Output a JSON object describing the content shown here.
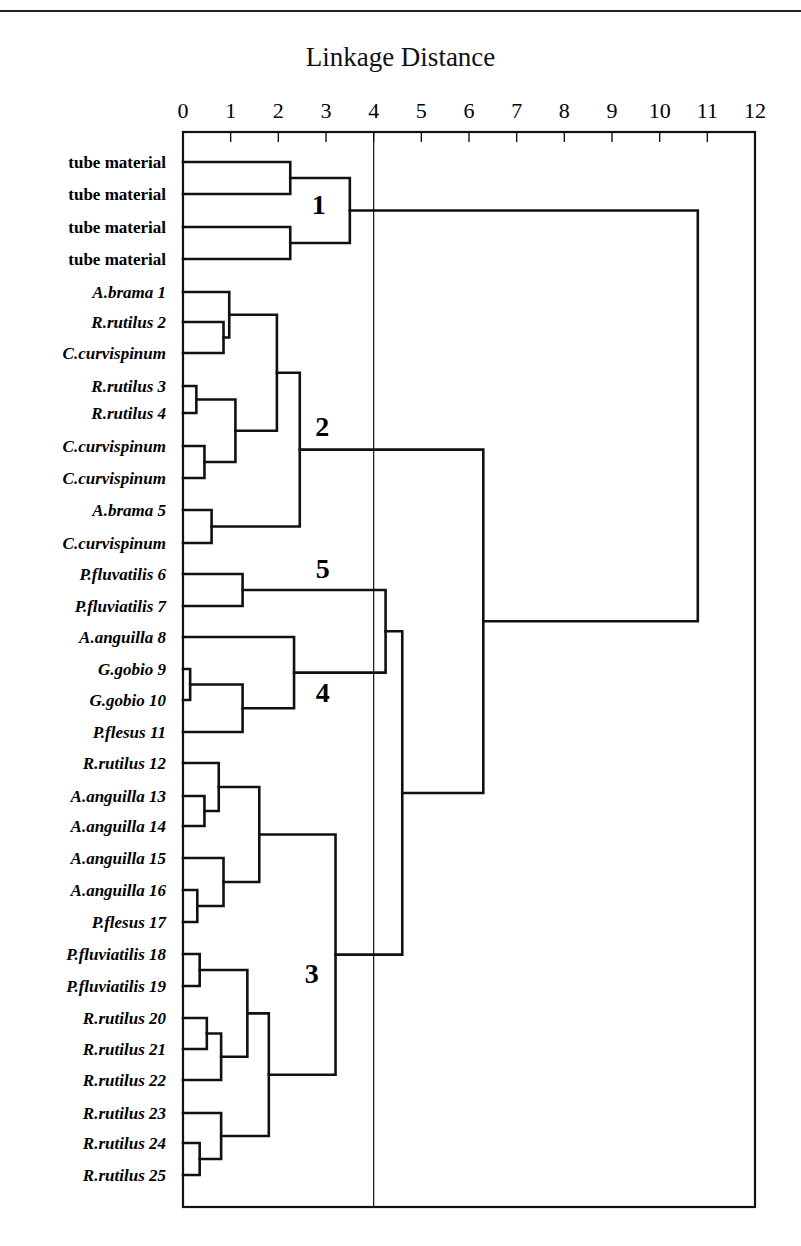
{
  "chart_data": {
    "type": "dendrogram",
    "title": "Linkage Distance",
    "xlabel": "Linkage Distance",
    "xlim": [
      0,
      12
    ],
    "x_ticks": [
      0,
      1,
      2,
      3,
      4,
      5,
      6,
      7,
      8,
      9,
      10,
      11,
      12
    ],
    "reference_line": 4,
    "orientation": "horizontal (leaves on left, distance increases to the right)",
    "leaves": [
      {
        "label": "tube material",
        "italic": false
      },
      {
        "label": "tube material",
        "italic": false
      },
      {
        "label": "tube material",
        "italic": false
      },
      {
        "label": "tube material",
        "italic": false
      },
      {
        "label": "A.brama 1",
        "italic": true
      },
      {
        "label": "R.rutilus 2",
        "italic": true
      },
      {
        "label": "C.curvispinum",
        "italic": true
      },
      {
        "label": "R.rutilus 3",
        "italic": true
      },
      {
        "label": "R.rutilus 4",
        "italic": true
      },
      {
        "label": "C.curvispinum",
        "italic": true
      },
      {
        "label": "C.curvispinum",
        "italic": true
      },
      {
        "label": "A.brama 5",
        "italic": true
      },
      {
        "label": "C.curvispinum",
        "italic": true
      },
      {
        "label": "P.fluvatilis 6",
        "italic": true
      },
      {
        "label": "P.fluviatilis 7",
        "italic": true
      },
      {
        "label": "A.anguilla 8",
        "italic": true
      },
      {
        "label": "G.gobio 9",
        "italic": true
      },
      {
        "label": "G.gobio 10",
        "italic": true
      },
      {
        "label": "P.flesus 11",
        "italic": true
      },
      {
        "label": "R.rutilus 12",
        "italic": true
      },
      {
        "label": "A.anguilla 13",
        "italic": true
      },
      {
        "label": "A.anguilla 14",
        "italic": true
      },
      {
        "label": "A.anguilla 15",
        "italic": true
      },
      {
        "label": "A.anguilla 16",
        "italic": true
      },
      {
        "label": "P.flesus 17",
        "italic": true
      },
      {
        "label": "P.fluviatilis 18",
        "italic": true
      },
      {
        "label": "P.fluviatilis 19",
        "italic": true
      },
      {
        "label": "R.rutilus 20",
        "italic": true
      },
      {
        "label": "R.rutilus 21",
        "italic": true
      },
      {
        "label": "R.rutilus 22",
        "italic": true
      },
      {
        "label": "R.rutilus 23",
        "italic": true
      },
      {
        "label": "R.rutilus 24",
        "italic": true
      },
      {
        "label": "R.rutilus 25",
        "italic": true
      }
    ],
    "merges": [
      {
        "id": "m1",
        "children": [
          "L0",
          "L1"
        ],
        "height": 2.25
      },
      {
        "id": "m2",
        "children": [
          "L2",
          "L3"
        ],
        "height": 2.25
      },
      {
        "id": "m3",
        "children": [
          "m1",
          "m2"
        ],
        "height": 3.5
      },
      {
        "id": "m4",
        "children": [
          "L5",
          "L6"
        ],
        "height": 0.85
      },
      {
        "id": "m5",
        "children": [
          "L4",
          "m4"
        ],
        "height": 0.97
      },
      {
        "id": "m6",
        "children": [
          "L7",
          "L8"
        ],
        "height": 0.28
      },
      {
        "id": "m7",
        "children": [
          "L9",
          "L10"
        ],
        "height": 0.45
      },
      {
        "id": "m8",
        "children": [
          "m6",
          "m7"
        ],
        "height": 1.1
      },
      {
        "id": "m9",
        "children": [
          "m5",
          "m8"
        ],
        "height": 1.97
      },
      {
        "id": "m10",
        "children": [
          "L11",
          "L12"
        ],
        "height": 0.6
      },
      {
        "id": "m11",
        "children": [
          "m9",
          "m10"
        ],
        "height": 2.45
      },
      {
        "id": "m12",
        "children": [
          "L13",
          "L14"
        ],
        "height": 1.25
      },
      {
        "id": "m13",
        "children": [
          "L16",
          "L17"
        ],
        "height": 0.15
      },
      {
        "id": "m14",
        "children": [
          "m13",
          "L18"
        ],
        "height": 1.25
      },
      {
        "id": "m15",
        "children": [
          "L15",
          "m14"
        ],
        "height": 2.33
      },
      {
        "id": "m16",
        "children": [
          "m12",
          "m15"
        ],
        "height": 4.25
      },
      {
        "id": "m17",
        "children": [
          "L20",
          "L21"
        ],
        "height": 0.45
      },
      {
        "id": "m18",
        "children": [
          "L19",
          "m17"
        ],
        "height": 0.75
      },
      {
        "id": "m19",
        "children": [
          "L23",
          "L24"
        ],
        "height": 0.3
      },
      {
        "id": "m20",
        "children": [
          "L22",
          "m19"
        ],
        "height": 0.85
      },
      {
        "id": "m21",
        "children": [
          "m18",
          "m20"
        ],
        "height": 1.6
      },
      {
        "id": "m22",
        "children": [
          "L25",
          "L26"
        ],
        "height": 0.35
      },
      {
        "id": "m23",
        "children": [
          "L27",
          "L28"
        ],
        "height": 0.5
      },
      {
        "id": "m24",
        "children": [
          "m23",
          "L29"
        ],
        "height": 0.8
      },
      {
        "id": "m25",
        "children": [
          "m22",
          "m24"
        ],
        "height": 1.35
      },
      {
        "id": "m26",
        "children": [
          "L31",
          "L32"
        ],
        "height": 0.35
      },
      {
        "id": "m27",
        "children": [
          "L30",
          "m26"
        ],
        "height": 0.8
      },
      {
        "id": "m28",
        "children": [
          "m25",
          "m27"
        ],
        "height": 1.8
      },
      {
        "id": "m29",
        "children": [
          "m21",
          "m28"
        ],
        "height": 3.2
      },
      {
        "id": "m30",
        "children": [
          "m16",
          "m29"
        ],
        "height": 4.6
      },
      {
        "id": "m31",
        "children": [
          "m11",
          "m30"
        ],
        "height": 6.3
      },
      {
        "id": "m32",
        "children": [
          "m3",
          "m31"
        ],
        "height": 10.8
      }
    ],
    "cluster_labels": [
      {
        "label": "1",
        "x_value": 2.85,
        "leaf_pos": 1.3
      },
      {
        "label": "2",
        "x_value": 2.92,
        "leaf_pos": 8.4
      },
      {
        "label": "5",
        "x_value": 2.93,
        "leaf_pos": 12.8
      },
      {
        "label": "4",
        "x_value": 2.93,
        "leaf_pos": 16.75
      },
      {
        "label": "3",
        "x_value": 2.7,
        "leaf_pos": 25.6
      }
    ]
  },
  "layout": {
    "plot_left": 183,
    "plot_right": 755,
    "plot_top": 132,
    "plot_bottom": 1207,
    "leaf_y": [
      162,
      194,
      227,
      259,
      292,
      322,
      353,
      386,
      413,
      446,
      478,
      510,
      543,
      574,
      606,
      637,
      669,
      700,
      732,
      763,
      796,
      826,
      858,
      890,
      922,
      954,
      986,
      1018,
      1049,
      1080,
      1113,
      1143,
      1175
    ],
    "line_color": "#111111",
    "frame_color": "#111111"
  }
}
